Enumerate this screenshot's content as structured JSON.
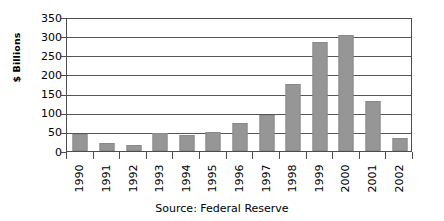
{
  "chart_data": {
    "type": "bar",
    "title": "",
    "xlabel": "",
    "ylabel": "$ Billions",
    "categories": [
      "1990",
      "1991",
      "1992",
      "1993",
      "1994",
      "1995",
      "1996",
      "1997",
      "1998",
      "1999",
      "2000",
      "2001",
      "2002"
    ],
    "values": [
      45,
      20,
      15,
      48,
      42,
      50,
      72,
      95,
      175,
      285,
      302,
      130,
      35
    ],
    "ylim": [
      0,
      350
    ],
    "ytick_step": 50,
    "yticks": [
      0,
      50,
      100,
      150,
      200,
      250,
      300,
      350
    ],
    "grid": true,
    "legend": "none",
    "bar_color": "#969696",
    "source_note": "Source: Federal Reserve"
  },
  "axes": {
    "y_title": "$ Billions",
    "y_ticks": [
      "350",
      "300",
      "250",
      "200",
      "150",
      "100",
      "50",
      "0"
    ],
    "x_ticks": [
      "1990",
      "1991",
      "1992",
      "1993",
      "1994",
      "1995",
      "1996",
      "1997",
      "1998",
      "1999",
      "2000",
      "2001",
      "2002"
    ]
  },
  "caption": {
    "source": "Source: Federal Reserve"
  },
  "colors": {
    "bar_fill": "#969696",
    "bar_stroke": "#8a8a8a",
    "gridline": "#555555",
    "axis": "#4c4c4c",
    "background": "#ffffff",
    "text": "#000000"
  }
}
